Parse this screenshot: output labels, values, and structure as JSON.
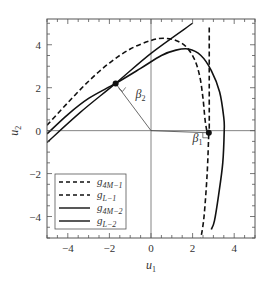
{
  "chart_data": {
    "type": "line",
    "title": "",
    "xlabel": "u1",
    "ylabel": "u2",
    "xlim": [
      -5.0,
      5.0
    ],
    "ylim": [
      -5.0,
      5.2
    ],
    "grid": false,
    "legend_position": "lower left",
    "xticks": [
      -4,
      -2,
      0,
      2,
      4
    ],
    "yticks": [
      -4,
      -2,
      0,
      2,
      4
    ],
    "xtick_labels": [
      "−4",
      "−2",
      "0",
      "2",
      "4"
    ],
    "ytick_labels": [
      "−4",
      "−2",
      "0",
      "2",
      "4"
    ],
    "series": [
      {
        "name": "g4M-1",
        "label_main": "g",
        "label_sub": "4M−1",
        "style": "dashed",
        "points": [
          [
            -5.0,
            0.25
          ],
          [
            -4.0,
            1.3
          ],
          [
            -3.0,
            2.3
          ],
          [
            -2.0,
            3.15
          ],
          [
            -1.0,
            3.8
          ],
          [
            0.0,
            4.2
          ],
          [
            0.6,
            4.3
          ],
          [
            1.2,
            4.2
          ],
          [
            1.7,
            3.9
          ],
          [
            2.1,
            3.3
          ],
          [
            2.35,
            2.5
          ],
          [
            2.5,
            1.5
          ],
          [
            2.6,
            0.5
          ],
          [
            2.7,
            -0.1
          ]
        ]
      },
      {
        "name": "gL-1",
        "label_main": "g",
        "label_sub": "L−1",
        "style": "dashed",
        "points": [
          [
            2.8,
            4.8
          ],
          [
            2.8,
            2.0
          ],
          [
            2.8,
            0.0
          ],
          [
            2.78,
            -0.1
          ],
          [
            2.7,
            -2.0
          ],
          [
            2.55,
            -4.0
          ],
          [
            2.4,
            -5.0
          ]
        ]
      },
      {
        "name": "g4M-2",
        "label_main": "g",
        "label_sub": "4M−2",
        "style": "solid",
        "points": [
          [
            -5.0,
            -0.15
          ],
          [
            -4.0,
            0.75
          ],
          [
            -3.0,
            1.5
          ],
          [
            -1.7,
            2.2
          ],
          [
            -0.5,
            2.9
          ],
          [
            0.5,
            3.5
          ],
          [
            1.2,
            3.75
          ],
          [
            1.8,
            3.8
          ],
          [
            2.4,
            3.5
          ],
          [
            2.9,
            2.8
          ],
          [
            3.3,
            1.8
          ],
          [
            3.5,
            0.6
          ],
          [
            3.52,
            0.0
          ],
          [
            3.45,
            -1.5
          ],
          [
            3.25,
            -3.0
          ],
          [
            3.05,
            -4.2
          ],
          [
            2.9,
            -4.6
          ]
        ]
      },
      {
        "name": "gL-2",
        "label_main": "g",
        "label_sub": "L−2",
        "style": "solid",
        "points": [
          [
            -5.0,
            -0.55
          ],
          [
            -3.4,
            0.85
          ],
          [
            -1.7,
            2.2
          ],
          [
            0.0,
            3.6
          ],
          [
            2.0,
            5.0
          ]
        ]
      }
    ],
    "annotations": [
      {
        "type": "point",
        "x": -1.7,
        "y": 2.2,
        "marker": "filled-circle"
      },
      {
        "type": "point",
        "x": 2.78,
        "y": -0.1,
        "marker": "filled-circle"
      },
      {
        "type": "segment",
        "from": [
          0,
          0
        ],
        "to": [
          -1.7,
          2.2
        ],
        "label": "β2"
      },
      {
        "type": "segment",
        "from": [
          0,
          0
        ],
        "to": [
          2.78,
          -0.1
        ],
        "label": "β1"
      },
      {
        "type": "text",
        "text": "β",
        "sub": "2",
        "x": -0.75,
        "y": 1.5
      },
      {
        "type": "text",
        "text": "β",
        "sub": "1",
        "x": 2.0,
        "y": -0.55
      }
    ],
    "axes_lines": {
      "x_zero": true,
      "y_zero": true
    }
  }
}
